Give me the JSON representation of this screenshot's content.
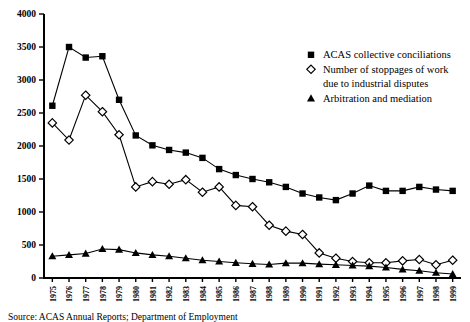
{
  "chart_data": {
    "type": "line",
    "title": "",
    "xlabel": "",
    "ylabel": "",
    "ylim": [
      0,
      4000
    ],
    "ytick_step": 500,
    "yticks": [
      "0",
      "500",
      "1000",
      "1500",
      "2000",
      "2500",
      "3000",
      "3500",
      "4000"
    ],
    "grid": false,
    "legend_position": "right-top",
    "categories": [
      "1975",
      "1976",
      "1977",
      "1978",
      "1979",
      "1980",
      "1981",
      "1982",
      "1983",
      "1984",
      "1985",
      "1986",
      "1987",
      "1988",
      "1989",
      "1990",
      "1991",
      "1992",
      "1993",
      "1994",
      "1995",
      "1996",
      "1997",
      "1998",
      "1999"
    ],
    "series": [
      {
        "name": "ACAS collective conciliations",
        "marker": "filled-square",
        "values": [
          2610,
          3500,
          3340,
          3360,
          2700,
          2160,
          2010,
          1940,
          1900,
          1820,
          1650,
          1560,
          1500,
          1450,
          1380,
          1280,
          1220,
          1180,
          1280,
          1400,
          1320,
          1320,
          1380,
          1340,
          1320
        ]
      },
      {
        "name": "Number of stoppages of work due to industrial disputes",
        "marker": "open-diamond",
        "values": [
          2350,
          2090,
          2770,
          2520,
          2170,
          1380,
          1460,
          1420,
          1490,
          1300,
          1380,
          1100,
          1080,
          800,
          710,
          660,
          380,
          300,
          250,
          230,
          230,
          260,
          280,
          200,
          270
        ]
      },
      {
        "name": "Arbitration and mediation",
        "marker": "filled-triangle",
        "values": [
          330,
          350,
          370,
          440,
          430,
          380,
          350,
          330,
          300,
          270,
          250,
          230,
          215,
          205,
          225,
          225,
          210,
          200,
          190,
          180,
          160,
          130,
          110,
          80,
          60
        ]
      }
    ]
  },
  "legend": {
    "items": [
      {
        "label": "ACAS collective conciliations",
        "marker": "filled-square"
      },
      {
        "label": "Number of stoppages of work",
        "label2": "due to industrial disputes",
        "marker": "open-diamond"
      },
      {
        "label": "Arbitration and mediation",
        "marker": "filled-triangle"
      }
    ]
  },
  "source": {
    "text": "Source: ACAS Annual Reports; Department of Employment"
  }
}
